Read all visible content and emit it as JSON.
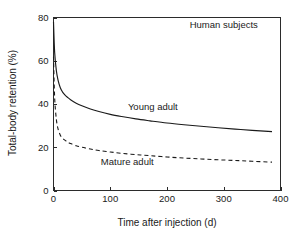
{
  "chart_data": {
    "type": "line",
    "title": "",
    "xlabel": "Time after injection (d)",
    "ylabel": "Total-body retention (%)",
    "xlim": [
      0,
      400
    ],
    "ylim": [
      0,
      80
    ],
    "xticks": [
      "0",
      "100",
      "200",
      "300",
      "400"
    ],
    "yticks": [
      "0",
      "20",
      "40",
      "60",
      "80"
    ],
    "xtick_values": [
      0,
      100,
      200,
      300,
      400
    ],
    "ytick_values": [
      0,
      20,
      40,
      60,
      80
    ],
    "grid": false,
    "legend_position": "inline-annotations",
    "annotations": [
      {
        "text": "Human subjects",
        "x": 300,
        "y": 75
      },
      {
        "text": "Young adult",
        "x": 175,
        "y": 37
      },
      {
        "text": "Mature adult",
        "x": 130,
        "y": 12
      }
    ],
    "series": [
      {
        "name": "Young adult",
        "style": "solid",
        "color": "#1a1a1a",
        "x": [
          0,
          2,
          5,
          8,
          12,
          16,
          20,
          25,
          30,
          40,
          50,
          65,
          80,
          100,
          120,
          145,
          170,
          200,
          230,
          260,
          290,
          320,
          350,
          385
        ],
        "values": [
          78.0,
          64.0,
          55.5,
          51.0,
          47.5,
          45.5,
          44.2,
          43.0,
          42.0,
          40.4,
          39.2,
          37.7,
          36.5,
          35.2,
          34.2,
          33.1,
          32.2,
          31.2,
          30.4,
          29.7,
          29.0,
          28.4,
          27.8,
          27.2
        ]
      },
      {
        "name": "Mature adult",
        "style": "dashed",
        "color": "#1a1a1a",
        "x": [
          0,
          2,
          5,
          8,
          12,
          16,
          20,
          25,
          30,
          40,
          50,
          65,
          80,
          100,
          120,
          145,
          170,
          200,
          230,
          260,
          290,
          320,
          350,
          385
        ],
        "values": [
          62.0,
          43.0,
          33.0,
          28.5,
          25.6,
          24.2,
          23.3,
          22.4,
          21.7,
          20.7,
          20.0,
          19.2,
          18.5,
          17.8,
          17.2,
          16.6,
          16.1,
          15.5,
          15.0,
          14.6,
          14.2,
          13.9,
          13.5,
          13.1
        ]
      }
    ]
  }
}
